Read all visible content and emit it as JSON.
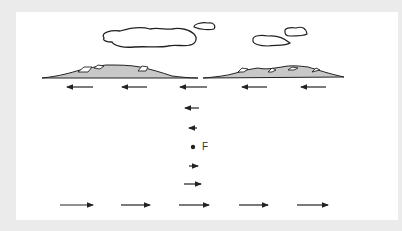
{
  "diagram": {
    "point_label": "F",
    "colors": {
      "background": "#ebebeb",
      "panel": "#ffffff",
      "land_fill": "#c8c8c8",
      "stroke": "#222222"
    },
    "top_arrows_direction": "left",
    "bottom_arrows_direction": "right",
    "top_arrow_count": 5,
    "bottom_arrow_count": 5,
    "vertical_arrows": [
      {
        "direction": "left",
        "position": "above-upper"
      },
      {
        "direction": "left",
        "position": "above-lower"
      },
      {
        "direction": "right",
        "position": "below-upper"
      },
      {
        "direction": "right",
        "position": "below-lower"
      }
    ]
  }
}
